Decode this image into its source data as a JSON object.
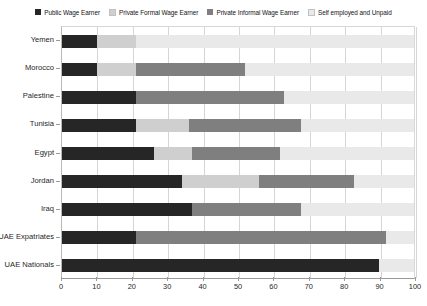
{
  "chart_data": {
    "type": "bar",
    "orientation": "horizontal",
    "stacked": true,
    "stack_mode": "percent",
    "title": "",
    "subtitle": "",
    "xlabel": "",
    "ylabel": "",
    "xlim": [
      0,
      100
    ],
    "xticks": [
      0,
      10,
      20,
      30,
      40,
      50,
      60,
      70,
      80,
      90,
      100
    ],
    "xtick_labels": [
      "0",
      "10",
      "20",
      "30",
      "40",
      "50",
      "60",
      "70",
      "80",
      "90",
      "100"
    ],
    "grid": true,
    "grid_axis": "x",
    "legend_position": "top",
    "categories": [
      "Yemen",
      "Morocco",
      "Palestine",
      "Tunisia",
      "Egypt",
      "Jordan",
      "Iraq",
      "UAE Expatriates",
      "UAE Nationals"
    ],
    "series": [
      {
        "name": "Public Wage Earner",
        "color": "#262626",
        "values": [
          10,
          10,
          21,
          21,
          26,
          34,
          37,
          21,
          90
        ]
      },
      {
        "name": "Private Formal Wage Earner",
        "color": "#cfcfcf",
        "values": [
          11,
          11,
          0,
          15,
          11,
          22,
          0,
          0,
          0
        ]
      },
      {
        "name": "Private Informal Wage Earner",
        "color": "#7f7f7f",
        "values": [
          0,
          31,
          42,
          32,
          25,
          27,
          31,
          71,
          0
        ]
      },
      {
        "name": "Self employed and Unpaid",
        "color": "#e9e9e9",
        "values": [
          79,
          48,
          37,
          32,
          38,
          17,
          32,
          8,
          10
        ]
      }
    ]
  },
  "legend": {
    "items": [
      {
        "label": "Public Wage Earner",
        "color": "#262626"
      },
      {
        "label": "Private Formal Wage Earner",
        "color": "#cfcfcf"
      },
      {
        "label": "Private Informal Wage Earner",
        "color": "#7f7f7f"
      },
      {
        "label": "Self employed and Unpaid",
        "color": "#e9e9e9"
      }
    ]
  },
  "colors": {
    "public_wage_earner": "#262626",
    "private_formal_wage_earner": "#cfcfcf",
    "private_informal_wage_earner": "#7f7f7f",
    "self_employed_and_unpaid": "#e9e9e9",
    "gridline": "#d5d5d5",
    "axis": "#9a9a9a",
    "background": "#ffffff",
    "text": "#1f1f1f"
  }
}
